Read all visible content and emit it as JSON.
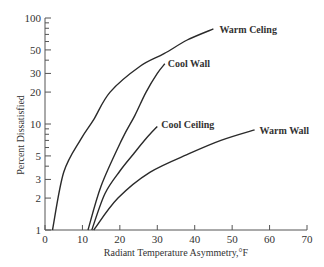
{
  "chart_data": {
    "type": "line",
    "title": "",
    "xlabel": "Radiant Temperature Asymmetry,°F",
    "ylabel": "Percent Dissatisfied",
    "xlim": [
      0,
      70
    ],
    "ylim": [
      1,
      100
    ],
    "yscale": "log",
    "grid": false,
    "legend": "inline labels at curve ends",
    "x_ticks": [
      0,
      10,
      20,
      30,
      40,
      50,
      60,
      70
    ],
    "y_tick_labels": [
      1,
      2,
      3,
      5,
      10,
      20,
      30,
      50,
      100
    ],
    "y_minor_ticks": [
      4,
      6,
      7,
      8,
      9,
      40,
      60,
      70,
      80,
      90
    ],
    "series": [
      {
        "name": "Warm Celing",
        "x": [
          2,
          5,
          9.6,
          13,
          17.4,
          25.4,
          31.8,
          38,
          45
        ],
        "y": [
          1,
          3.5,
          7.2,
          11,
          20,
          35,
          46,
          62,
          79
        ]
      },
      {
        "name": "Cool Wall",
        "x": [
          11.5,
          15,
          20.6,
          24,
          27,
          30,
          32
        ],
        "y": [
          1,
          2.6,
          7.2,
          12,
          20,
          30,
          37
        ]
      },
      {
        "name": "Cool Ceiling",
        "x": [
          12.5,
          16,
          20,
          23.8,
          27,
          30
        ],
        "y": [
          1,
          2.2,
          3.6,
          5.3,
          7.3,
          9.5
        ]
      },
      {
        "name": "Warm Wall",
        "x": [
          13,
          19.5,
          28,
          38.8,
          47,
          56
        ],
        "y": [
          1,
          2,
          3.5,
          5.3,
          7,
          8.8
        ]
      }
    ]
  },
  "colors": {
    "line": "#2a2a2a",
    "axis": "#555555",
    "background": "#ffffff"
  }
}
